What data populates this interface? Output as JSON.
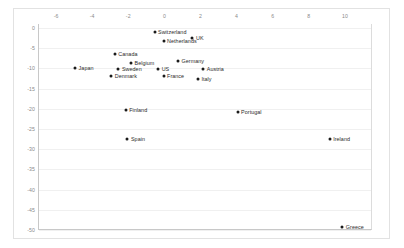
{
  "chart_data": {
    "type": "scatter",
    "title": "",
    "xlabel": "",
    "ylabel": "",
    "xlim": [
      -7,
      11.5
    ],
    "ylim": [
      -50,
      1
    ],
    "xticks": [
      -6,
      -4,
      -2,
      0,
      2,
      4,
      6,
      8,
      10
    ],
    "xtick_labels": [
      "-6",
      "-4",
      "-2",
      "0",
      "2",
      "4",
      "6",
      "8",
      "10"
    ],
    "yticks": [
      0,
      -5,
      -10,
      -15,
      -20,
      -25,
      -30,
      -35,
      -40,
      -45,
      -50
    ],
    "ytick_labels": [
      "0",
      "-5",
      "-10",
      "-15",
      "-20",
      "-25",
      "-30",
      "-35",
      "-40",
      "-45",
      "-50"
    ],
    "grid": "horizontal",
    "legend": "none",
    "xaxis_position": "top",
    "marker_color": "#1a1a1a",
    "gridline_color": "#f0f0f0",
    "axis_color": "#c8c8c8",
    "tick_label_color": "#8a8a8a",
    "point_label_color": "#2b2b2b",
    "points": [
      {
        "label": "Switzerland",
        "x": -0.6,
        "y": -1.1,
        "label_side": "right"
      },
      {
        "label": "UK",
        "x": 1.5,
        "y": -2.4,
        "label_side": "right"
      },
      {
        "label": "Netherlands",
        "x": -0.1,
        "y": -3.3,
        "label_side": "right"
      },
      {
        "label": "Canada",
        "x": -2.8,
        "y": -6.4,
        "label_side": "right"
      },
      {
        "label": "Germany",
        "x": 0.7,
        "y": -8.1,
        "label_side": "right"
      },
      {
        "label": "Belgium",
        "x": -1.9,
        "y": -8.7,
        "label_side": "right"
      },
      {
        "label": "Japan",
        "x": -5.0,
        "y": -10.0,
        "label_side": "right"
      },
      {
        "label": "Sweden",
        "x": -2.6,
        "y": -10.2,
        "label_side": "right"
      },
      {
        "label": "US",
        "x": -0.4,
        "y": -10.2,
        "label_side": "right"
      },
      {
        "label": "Austria",
        "x": 2.1,
        "y": -10.1,
        "label_side": "right"
      },
      {
        "label": "Denmark",
        "x": -3.0,
        "y": -11.9,
        "label_side": "right"
      },
      {
        "label": "France",
        "x": -0.1,
        "y": -11.9,
        "label_side": "right"
      },
      {
        "label": "Italy",
        "x": 1.8,
        "y": -12.6,
        "label_side": "right"
      },
      {
        "label": "Finland",
        "x": -2.2,
        "y": -20.3,
        "label_side": "right"
      },
      {
        "label": "Portugal",
        "x": 4.0,
        "y": -20.8,
        "label_side": "right"
      },
      {
        "label": "Spain",
        "x": -2.1,
        "y": -27.4,
        "label_side": "right"
      },
      {
        "label": "Ireland",
        "x": 9.1,
        "y": -27.4,
        "label_side": "right"
      },
      {
        "label": "Greece",
        "x": 9.8,
        "y": -49.3,
        "label_side": "right"
      }
    ]
  }
}
